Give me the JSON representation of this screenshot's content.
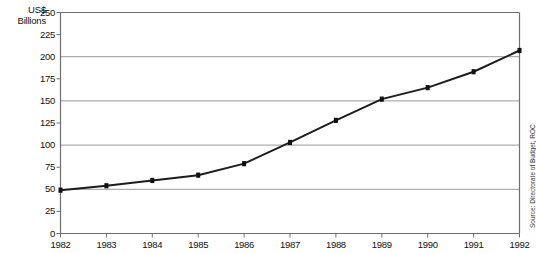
{
  "chart_data": {
    "type": "line",
    "title": "",
    "subtitle": "",
    "xlabel": "",
    "ylabel": "US$ Billions",
    "ylabel_lines": [
      "US$",
      "Billions"
    ],
    "x": [
      1982,
      1983,
      1984,
      1985,
      1986,
      1987,
      1988,
      1989,
      1990,
      1991,
      1992
    ],
    "categories": [
      "1982",
      "1983",
      "1984",
      "1985",
      "1986",
      "1987",
      "1988",
      "1989",
      "1990",
      "1991",
      "1992"
    ],
    "values": [
      49,
      54,
      60,
      66,
      79,
      103,
      128,
      152,
      165,
      183,
      207
    ],
    "series": [
      {
        "name": "",
        "values": [
          49,
          54,
          60,
          66,
          79,
          103,
          128,
          152,
          165,
          183,
          207
        ],
        "line_color": "#1c1c1c",
        "marker": "square",
        "marker_color": "#111111"
      }
    ],
    "ylim": [
      0,
      250
    ],
    "xlim": [
      1982,
      1992
    ],
    "ytick_labels": [
      "0",
      "25",
      "50",
      "75",
      "100",
      "125",
      "150",
      "175",
      "200",
      "225",
      "250"
    ],
    "ytick_values": [
      0,
      25,
      50,
      75,
      100,
      125,
      150,
      175,
      200,
      225,
      250
    ],
    "major_gridline_values": [
      0,
      50,
      100,
      150,
      200,
      250
    ],
    "minor_tick_values": [
      25,
      75,
      125,
      175,
      225
    ],
    "grid": "horizontal-major-only",
    "grid_color": "#9a9a9a",
    "axis_color": "#6e6e6e",
    "background_color": "#ffffff",
    "legend": "none",
    "legend_position": "none",
    "annotations": [
      {
        "text": "Source: Directorate of Budget, ROC",
        "position": "right-edge-vertical"
      }
    ]
  },
  "source_note": "Source: Directorate of Budget, ROC"
}
